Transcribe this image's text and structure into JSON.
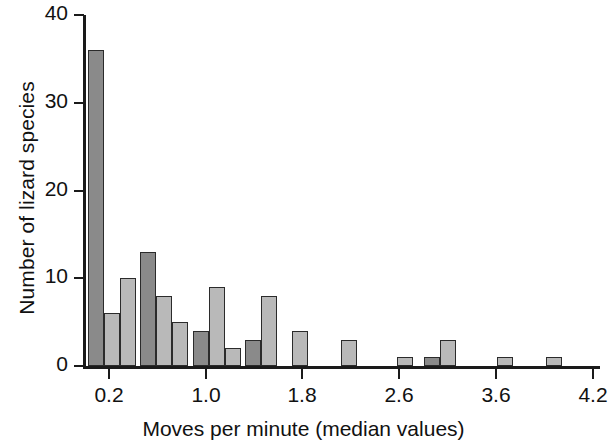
{
  "chart_data": {
    "type": "bar",
    "title": "",
    "xlabel": "Moves per minute (median values)",
    "ylabel": "Number of lizard species",
    "xlim": [
      0.0,
      4.3
    ],
    "ylim": [
      0,
      40
    ],
    "grid": false,
    "legend": "none",
    "y_ticks": [
      0,
      10,
      20,
      30,
      40
    ],
    "y_tick_labels": [
      "0",
      "10",
      "20",
      "30",
      "40"
    ],
    "x_ticks": [
      0.2,
      1.0,
      1.8,
      2.6,
      3.6,
      4.2
    ],
    "x_tick_labels": [
      "0.2",
      "1.0",
      "1.8",
      "2.6",
      "3.6",
      "4.2"
    ],
    "bin_width": 0.16,
    "colors": {
      "dark_bar": "#8a8a8a",
      "light_bar": "#b9b9b9",
      "outline": "#2b2b2b",
      "axis": "#1a1a1a",
      "background": "#ffffff"
    },
    "categories": [
      "0.04",
      "0.20",
      "0.36",
      "0.52",
      "0.68",
      "0.84",
      "1.00",
      "1.16",
      "1.32",
      "1.48",
      "1.64",
      "1.80",
      "1.96",
      "2.12",
      "2.28",
      "2.44",
      "2.60",
      "2.76",
      "2.92",
      "3.08",
      "3.24",
      "3.40",
      "3.56",
      "3.72",
      "3.88",
      "4.04"
    ],
    "values": [
      36,
      6,
      10,
      13,
      8,
      5,
      4,
      9,
      2,
      3,
      8,
      0,
      4,
      0,
      3,
      0,
      0,
      1,
      1,
      3,
      0,
      0,
      1,
      0,
      1,
      0
    ],
    "bars": [
      {
        "x_px": 88,
        "value": 36,
        "shade": "dark"
      },
      {
        "x_px": 104,
        "value": 6,
        "shade": "light"
      },
      {
        "x_px": 120,
        "value": 10,
        "shade": "light"
      },
      {
        "x_px": 140,
        "value": 13,
        "shade": "dark"
      },
      {
        "x_px": 156,
        "value": 8,
        "shade": "light"
      },
      {
        "x_px": 172,
        "value": 5,
        "shade": "light"
      },
      {
        "x_px": 193,
        "value": 4,
        "shade": "dark"
      },
      {
        "x_px": 209,
        "value": 9,
        "shade": "light"
      },
      {
        "x_px": 225,
        "value": 2,
        "shade": "light"
      },
      {
        "x_px": 245,
        "value": 3,
        "shade": "dark"
      },
      {
        "x_px": 261,
        "value": 8,
        "shade": "light"
      },
      {
        "x_px": 292,
        "value": 4,
        "shade": "light"
      },
      {
        "x_px": 341,
        "value": 3,
        "shade": "light"
      },
      {
        "x_px": 397,
        "value": 1,
        "shade": "light"
      },
      {
        "x_px": 424,
        "value": 1,
        "shade": "dark"
      },
      {
        "x_px": 440,
        "value": 3,
        "shade": "light"
      },
      {
        "x_px": 497,
        "value": 1,
        "shade": "light"
      },
      {
        "x_px": 546,
        "value": 1,
        "shade": "light"
      }
    ]
  }
}
